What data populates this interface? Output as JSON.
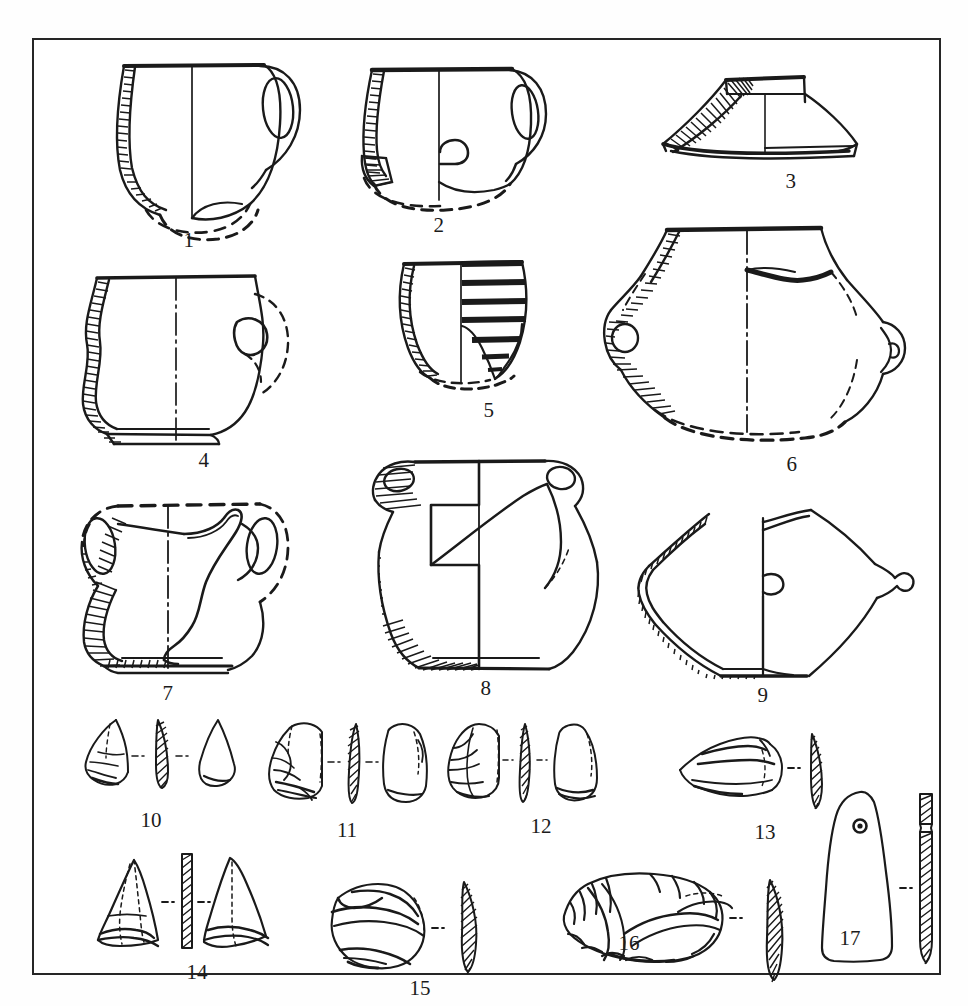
{
  "plate": {
    "title": "Archaeological finds plate",
    "description": "Line-drawing plate of prehistoric pottery profiles and chipped/polished stone tools",
    "frame_color": "#262626",
    "ink_color": "#1a1a1a",
    "background_color": "#ffffff",
    "object_count": 17,
    "labels": [
      "1",
      "2",
      "3",
      "4",
      "5",
      "6",
      "7",
      "8",
      "9",
      "10",
      "11",
      "12",
      "13",
      "14",
      "15",
      "16",
      "17"
    ]
  },
  "objects": [
    {
      "id": "1",
      "label": "1",
      "category": "pottery",
      "type": "handled-cup",
      "row": 1,
      "col": 1,
      "label_x": 155,
      "label_y": 222,
      "features": "one-handled cup, everted rim, hatched wall section on left, dashed reconstructed base"
    },
    {
      "id": "2",
      "label": "2",
      "category": "pottery",
      "type": "handled-cup",
      "row": 1,
      "col": 2,
      "label_x": 406,
      "label_y": 212,
      "features": "one-handled cup with small lug, hatched section, dashed reconstructed base"
    },
    {
      "id": "3",
      "label": "3",
      "category": "pottery",
      "type": "pedestal-foot",
      "row": 1,
      "col": 3,
      "label_x": 757,
      "label_y": 155,
      "features": "conical hollow pedestal foot / stand, hatched wall section"
    },
    {
      "id": "4",
      "label": "4",
      "category": "pottery",
      "type": "lugged-pot",
      "row": 2,
      "col": 1,
      "label_x": 170,
      "label_y": 448,
      "features": "S-profiled pot with knob lug, hatched section, footring base"
    },
    {
      "id": "5",
      "label": "5",
      "category": "pottery",
      "type": "decorated-beaker",
      "row": 2,
      "col": 2,
      "label_x": 455,
      "label_y": 383,
      "features": "beaker with horizontal incised/impressed banded decoration, hatched section"
    },
    {
      "id": "6",
      "label": "6",
      "category": "pottery",
      "type": "amphora-jar",
      "row": 2,
      "col": 3,
      "label_x": 758,
      "label_y": 452,
      "features": "biconical jar with two pierced horizontal lug handles, hatched section"
    },
    {
      "id": "7",
      "label": "7",
      "category": "pottery",
      "type": "two-handled-cup",
      "row": 3,
      "col": 1,
      "label_x": 163,
      "label_y": 665,
      "features": "two high strap-handled cup, hatched section, dashed reconstructed rim"
    },
    {
      "id": "8",
      "label": "8",
      "category": "pottery",
      "type": "biconical-jar",
      "row": 3,
      "col": 2,
      "label_x": 452,
      "label_y": 668,
      "features": "large biconical jar with two small lug handles, hatched base section"
    },
    {
      "id": "9",
      "label": "9",
      "category": "pottery",
      "type": "carinated-bowl",
      "row": 3,
      "col": 3,
      "label_x": 755,
      "label_y": 665,
      "features": "sharply carinated bowl with small knobs, hatched wall section"
    },
    {
      "id": "10",
      "label": "10",
      "category": "lithic",
      "type": "flake-point",
      "row": 4,
      "col": 1,
      "label_x": 117,
      "label_y": 789,
      "views": "obverse, hatched cross-section, reverse"
    },
    {
      "id": "11",
      "label": "11",
      "category": "lithic",
      "type": "retouched-flake",
      "row": 4,
      "col": 2,
      "label_x": 313,
      "label_y": 800,
      "views": "obverse, hatched cross-section, reverse"
    },
    {
      "id": "12",
      "label": "12",
      "category": "lithic",
      "type": "blade-flake",
      "row": 4,
      "col": 3,
      "label_x": 508,
      "label_y": 794,
      "views": "obverse, hatched cross-section, reverse"
    },
    {
      "id": "13",
      "label": "13",
      "category": "lithic",
      "type": "scraper",
      "row": 4,
      "col": 4,
      "label_x": 731,
      "label_y": 800,
      "views": "obverse, hatched cross-section"
    },
    {
      "id": "14",
      "label": "14",
      "category": "lithic",
      "type": "triangular-arrowhead",
      "row": 5,
      "col": 1,
      "label_x": 163,
      "label_y": 933,
      "views": "obverse, hatched rectangular cross-section, reverse"
    },
    {
      "id": "15",
      "label": "15",
      "category": "lithic",
      "type": "discoidal-scraper",
      "row": 5,
      "col": 2,
      "label_x": 386,
      "label_y": 928,
      "views": "obverse, hatched lenticular cross-section"
    },
    {
      "id": "16",
      "label": "16",
      "category": "lithic",
      "type": "retouched-core-tool",
      "row": 5,
      "col": 3,
      "label_x": 627,
      "label_y": 943,
      "views": "obverse, hatched lenticular cross-section"
    },
    {
      "id": "17",
      "label": "17",
      "category": "stone-tool",
      "type": "perforated-polished-adze",
      "row": 5,
      "col": 4,
      "label_x": 848,
      "label_y": 938,
      "views": "face with drilled perforation, hatched longitudinal section"
    }
  ]
}
